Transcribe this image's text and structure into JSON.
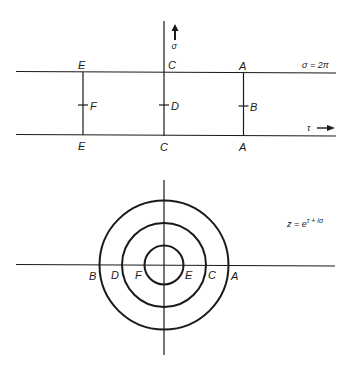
{
  "top_diagram": {
    "axis_labels": {
      "sigma": "σ",
      "tau": "τ",
      "top_line": "σ = 2π"
    },
    "upper_labels": [
      "E",
      "C",
      "A"
    ],
    "lower_labels": [
      "E",
      "C",
      "A"
    ],
    "midpoint_labels": [
      "F",
      "D",
      "B"
    ]
  },
  "bottom_diagram": {
    "equation": {
      "base": "z = e",
      "exponent": "τ + iσ"
    },
    "left_labels": [
      "B",
      "D",
      "F"
    ],
    "right_labels": [
      "E",
      "C",
      "A"
    ]
  }
}
